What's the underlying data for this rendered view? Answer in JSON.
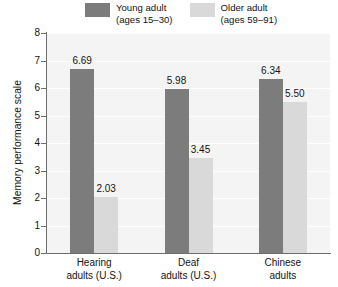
{
  "chart_data": {
    "type": "bar",
    "title": "",
    "xlabel": "",
    "ylabel": "Memory performance scale",
    "ylim": [
      0,
      8
    ],
    "ytick_labels": [
      "8",
      "7",
      "6",
      "5",
      "4",
      "3",
      "2",
      "1",
      "0"
    ],
    "grid": true,
    "legend_position": "top",
    "categories": [
      "Hearing adults (U.S.)",
      "Deaf adults (U.S.)",
      "Chinese adults"
    ],
    "category_lines": [
      [
        "Hearing",
        "adults (U.S.)"
      ],
      [
        "Deaf",
        "adults (U.S.)"
      ],
      [
        "Chinese",
        "adults"
      ]
    ],
    "series": [
      {
        "name": "Young adult",
        "name_line2": "(ages 15–30)",
        "color": "#7c7c7c",
        "values": [
          6.69,
          5.98,
          6.34
        ],
        "value_labels": [
          "6.69",
          "5.98",
          "6.34"
        ]
      },
      {
        "name": "Older adult",
        "name_line2": "(ages 59–91)",
        "color": "#d9d9d9",
        "values": [
          2.03,
          3.45,
          5.5
        ],
        "value_labels": [
          "2.03",
          "3.45",
          "5.50"
        ]
      }
    ]
  },
  "colors": {
    "plot_background": "#f4f4f4",
    "axis": "#6e6e6e",
    "gridline": "#ffffff",
    "text": "#141414",
    "young_adult": "#7c7c7c",
    "older_adult": "#d9d9d9"
  }
}
